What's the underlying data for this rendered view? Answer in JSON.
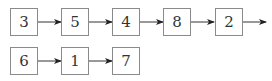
{
  "diagram": {
    "type": "linked-lists",
    "rows": [
      {
        "nodes": [
          "3",
          "5",
          "4",
          "8",
          "2"
        ],
        "trailing_arrow": true
      },
      {
        "nodes": [
          "6",
          "1",
          "7"
        ],
        "trailing_arrow": false
      }
    ]
  }
}
